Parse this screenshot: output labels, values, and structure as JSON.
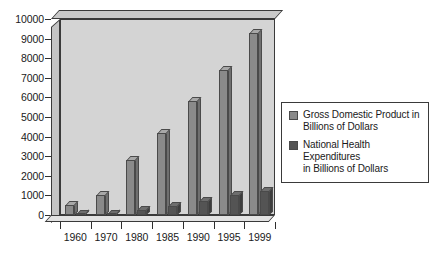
{
  "chart_data": {
    "type": "bar",
    "title": "",
    "subtitle": "",
    "xlabel": "",
    "ylabel": "",
    "categories": [
      "1960",
      "1970",
      "1980",
      "1985",
      "1990",
      "1995",
      "1999"
    ],
    "series": [
      {
        "name": "Gross Domestic Product in Billions of Dollars",
        "color": "#8a8a8a",
        "values": [
          526,
          1038,
          2784,
          4181,
          5803,
          7401,
          9299
        ]
      },
      {
        "name": "National Health Expenditures in Billions of Dollars",
        "color": "#545454",
        "values": [
          27,
          75,
          253,
          439,
          714,
          1017,
          1211
        ]
      }
    ],
    "ylim": [
      0,
      10000
    ],
    "ytick_step": 1000,
    "ytick_labels": [
      "0",
      "1000",
      "2000",
      "3000",
      "4000",
      "5000",
      "6000",
      "7000",
      "8000",
      "9000",
      "10000"
    ],
    "ytick_values": [
      0,
      1000,
      2000,
      3000,
      4000,
      5000,
      6000,
      7000,
      8000,
      9000,
      10000
    ],
    "xtick_labels": [
      "1960",
      "1970",
      "1980",
      "1985",
      "1990",
      "1995",
      "1999"
    ],
    "grid": false,
    "legend_position": "right",
    "style": "3d-bar-grayscale"
  },
  "legend": {
    "entries": [
      {
        "label_line1": "Gross Domestic Product in",
        "label_line2": "Billions of Dollars",
        "swatch_name": "legend-swatch-gdp"
      },
      {
        "label_line1": "National Health Expenditures",
        "label_line2": "in Billions of Dollars",
        "swatch_name": "legend-swatch-health"
      }
    ]
  },
  "colors": {
    "gdp_bar": "#8a8a8a",
    "health_bar": "#545454",
    "plot_wall": "#d4d4d4",
    "plot_top": "#c9c9c9",
    "axis_line": "#2e2e2e",
    "text": "#1a1a1a",
    "background": "#ffffff"
  }
}
